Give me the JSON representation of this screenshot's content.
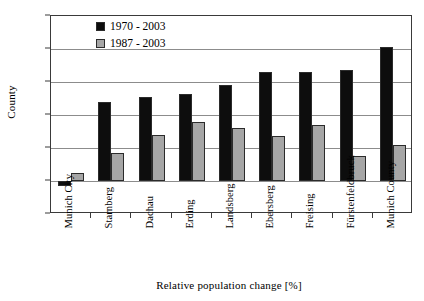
{
  "chart_data": {
    "type": "bar",
    "title": "",
    "xlabel": "Relative population change [%]",
    "ylabel": "County",
    "ylim": [
      -20,
      100
    ],
    "yticks": [
      -20,
      0,
      20,
      40,
      60,
      80,
      100
    ],
    "ytick_labels": [
      "-20",
      "0",
      "20",
      "40",
      "60",
      "80",
      "100"
    ],
    "grid": true,
    "legend_position": "top-left-inside",
    "categories": [
      "Munich City",
      "Starnberg",
      "Dachau",
      "Erding",
      "Landsberg",
      "Ebersberg",
      "Freising",
      "Fürstenfeldbruck",
      "Munich County"
    ],
    "series": [
      {
        "name": "1970 - 2003",
        "color": "#0d0d0d",
        "values": [
          -3,
          48,
          51,
          53,
          58,
          66,
          66,
          67,
          81
        ]
      },
      {
        "name": "1987 - 2003",
        "color": "#a6a6a6",
        "values": [
          5,
          17,
          28,
          36,
          32,
          27,
          34,
          15,
          22
        ]
      }
    ]
  },
  "legend": {
    "items": [
      {
        "label": "1970 - 2003",
        "color": "#0d0d0d"
      },
      {
        "label": "1987 - 2003",
        "color": "#a6a6a6"
      }
    ]
  },
  "axes": {
    "y_title": "County",
    "x_title": "Relative population change [%]"
  }
}
